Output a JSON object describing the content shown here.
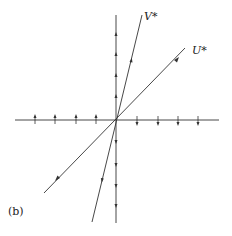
{
  "diagram": {
    "labels": {
      "v": "V*",
      "u": "U*",
      "panel": "(b)"
    },
    "origin": [
      116,
      120
    ],
    "line_color": "#333333",
    "axes": {
      "horizontal": {
        "x1": 15,
        "y1": 120,
        "x2": 219,
        "y2": 120
      },
      "vertical": {
        "x1": 116,
        "y1": 15,
        "x2": 116,
        "y2": 223
      }
    },
    "lines": {
      "v_line": {
        "x1": 92,
        "y1": 222,
        "x2": 142,
        "y2": 15
      },
      "u_line": {
        "x1": 44,
        "y1": 193,
        "x2": 185,
        "y2": 48
      }
    },
    "arrows": {
      "left_axis_up": [
        35,
        55,
        76,
        96
      ],
      "right_axis_down": [
        137,
        158,
        178,
        198
      ],
      "vertical_upper_up": [
        34,
        54,
        75,
        96
      ],
      "vertical_lower_down": [
        142,
        165,
        186,
        206
      ]
    }
  }
}
